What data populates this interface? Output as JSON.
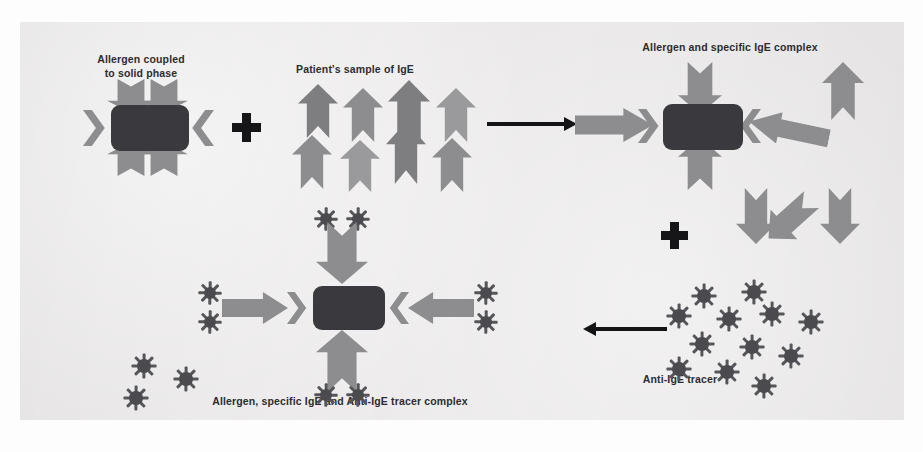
{
  "figure": {
    "type": "immunoassay-schematic",
    "background_color": "#eceaea",
    "colors": {
      "allergen_block": "#3a3a3e",
      "ige_arrow": "#8d8d8f",
      "tracer": "#4b4b4f",
      "process_arrow": "#141416",
      "caption_text": "#2c2c30"
    }
  },
  "captions": {
    "allergen_solid_phase": "Allergen coupled\nto solid phase",
    "allergen_solid_phase_line1": "Allergen coupled",
    "allergen_solid_phase_line2": "to solid phase",
    "patient_sample": "Patient's sample of IgE",
    "allergen_ige_complex": "Allergen and specific IgE complex",
    "final_complex": "Allergen, specific IgE and Anti-IgE tracer complex",
    "anti_ige_tracer": "Anti-IgE tracer"
  },
  "steps": [
    {
      "id": "step-1-allergen",
      "label": "Allergen coupled to solid phase",
      "element": "allergen-block-with-four-bound-arrows"
    },
    {
      "id": "step-2-sample",
      "label": "Patient's sample of IgE",
      "element": "free-ige-arrows",
      "arrow_count": 9
    },
    {
      "id": "step-3-complex",
      "label": "Allergen and specific IgE complex",
      "element": "allergen-block-with-bound-ige",
      "free_arrow_count": 4
    },
    {
      "id": "step-4-tracer",
      "label": "Anti-IgE tracer",
      "element": "free-tracer-starbursts",
      "tracer_count": 11
    },
    {
      "id": "step-5-final",
      "label": "Allergen, specific IgE and Anti-IgE tracer complex",
      "element": "allergen-ige-tracer-sandwich",
      "free_tracer_count": 3
    }
  ],
  "symbols": {
    "plus_top": "+",
    "plus_middle": "+",
    "process_arrow_top": "→",
    "process_arrow_bottom": "←"
  },
  "ghost_text": {
    "line1": "",
    "line2": "",
    "line3": "",
    "line4": ""
  }
}
